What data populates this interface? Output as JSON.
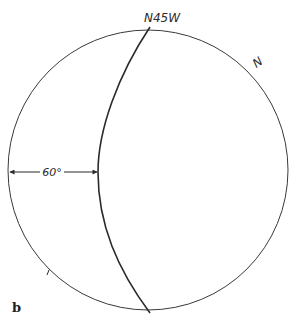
{
  "diagram": {
    "type": "stereonet",
    "panel_label": "b",
    "primitive_circle": {
      "cx": 148,
      "cy": 170,
      "r": 140,
      "color": "#3a3a3a"
    },
    "great_circle": {
      "strike_label": "N45W",
      "color": "#2a2a2a"
    },
    "north_label": "N",
    "dip_angle_label": "60°",
    "dip_angle_value": 60
  }
}
